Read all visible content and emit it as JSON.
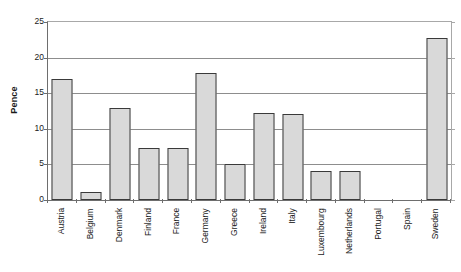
{
  "chart_data": {
    "type": "bar",
    "title": "",
    "xlabel": "",
    "ylabel": "Pence",
    "ylim": [
      0,
      25
    ],
    "yticks": [
      0,
      5,
      10,
      15,
      20,
      25
    ],
    "ytick_labels": [
      "0",
      "5",
      "10",
      "15",
      "20",
      "25"
    ],
    "grid": true,
    "legend": false,
    "categories": [
      "Austria",
      "Belgium",
      "Denmark",
      "Finland",
      "France",
      "Germany",
      "Greece",
      "Ireland",
      "Italy",
      "Luxembourg",
      "Netherlands",
      "Portugal",
      "Spain",
      "Sweden"
    ],
    "values": [
      17,
      1.1,
      12.9,
      7.3,
      7.3,
      17.9,
      5.1,
      12.2,
      12.1,
      4.1,
      4.1,
      0,
      0,
      22.7
    ],
    "bar_fill_color": "#d9d9d9",
    "bar_border_color": "#3a3a3a",
    "gridline_color": "#8d8d8d",
    "axis_color": "#6e6e6e"
  }
}
